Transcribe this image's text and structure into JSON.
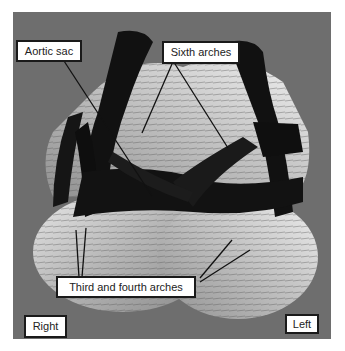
{
  "figure": {
    "background_color": "#6e6e6e",
    "labels": {
      "aortic_sac": "Aortic sac",
      "sixth_arches": "Sixth arches",
      "third_fourth_arches": "Third and fourth arches",
      "right": "Right",
      "left": "Left"
    }
  }
}
